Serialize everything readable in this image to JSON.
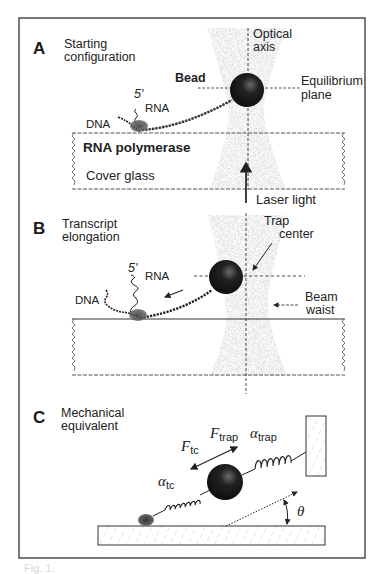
{
  "figure": {
    "border_color": "#333333",
    "beam_color": "#8a8a8a",
    "bead_color": "#151515",
    "panels": [
      {
        "letter": "A",
        "title_line1": "Starting",
        "title_line2": "configuration",
        "labels": {
          "optical_axis_1": "Optical",
          "optical_axis_2": "axis",
          "bead": "Bead",
          "equilibrium_1": "Equilibrium",
          "equilibrium_2": "plane",
          "five_prime": "5'",
          "rna": "RNA",
          "dna": "DNA",
          "polymerase": "RNA polymerase",
          "cover_glass": "Cover glass",
          "laser": "Laser light"
        }
      },
      {
        "letter": "B",
        "title_line1": "Transcript",
        "title_line2": "elongation",
        "labels": {
          "trap_1": "Trap",
          "trap_2": "center",
          "five_prime": "5'",
          "rna": "RNA",
          "dna": "DNA",
          "beam_1": "Beam",
          "beam_2": "waist"
        }
      },
      {
        "letter": "C",
        "title_line1": "Mechanical",
        "title_line2": "equivalent",
        "labels": {
          "f_tc": "F",
          "f_tc_sub": "tc",
          "f_trap": "F",
          "f_trap_sub": "trap",
          "alpha_trap": "α",
          "alpha_trap_sub": "trap",
          "alpha_tc": "α",
          "alpha_tc_sub": "tc",
          "theta": "θ"
        }
      }
    ],
    "caption": "Fig. 1."
  }
}
